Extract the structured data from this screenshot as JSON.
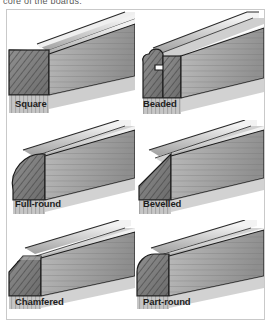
{
  "caption": {
    "text": "core of the boards."
  },
  "figure": {
    "columns": 2,
    "rows": 3,
    "background_color": "#ffffff",
    "border_color": "#c9c9c9",
    "label_color": "#1d1d1d"
  },
  "profiles": [
    {
      "label": "Square",
      "shape": "square",
      "description": "Board edge left square with sharp 90 degree arris",
      "row": 1,
      "column": 1
    },
    {
      "label": "Beaded",
      "shape": "beaded",
      "description": "Rounded bead worked along the edge with a quirk notch below",
      "row": 1,
      "column": 2
    },
    {
      "label": "Full-round",
      "shape": "full-round",
      "description": "Edge rounded over the full thickness of the board",
      "row": 2,
      "column": 1
    },
    {
      "label": "Bevelled",
      "shape": "bevelled",
      "description": "Edge planed to a wide flat angled bevel",
      "row": 2,
      "column": 2
    },
    {
      "label": "Chamfered",
      "shape": "chamfered",
      "description": "Small flat chamfer cut across the corner arris",
      "row": 3,
      "column": 1
    },
    {
      "label": "Part-round",
      "shape": "part-round",
      "description": "Corner rounded over part way leaving a flat top face",
      "row": 3,
      "column": 2
    }
  ],
  "render": {
    "endgrain_fill": "#8a8a8a",
    "endgrain_hatch": "#3f3f3f",
    "face_fill": "#b4b4b4",
    "top_fill": "#d8d8d8",
    "edge_line": "#1a1a1a",
    "shadow_fill": "#9a9a9a"
  }
}
